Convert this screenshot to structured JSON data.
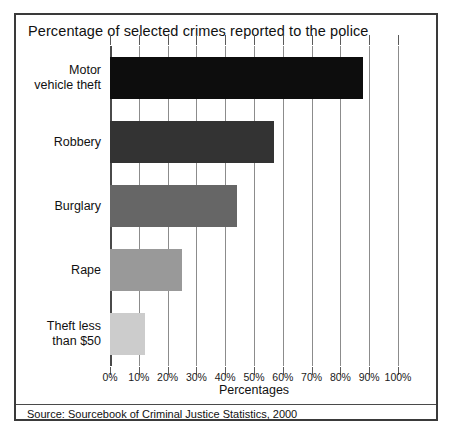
{
  "chart_data": {
    "type": "bar",
    "orientation": "horizontal",
    "title": "Percentage of selected crimes reported to the police",
    "xlabel": "Percentages",
    "ylabel": "",
    "xlim": [
      0,
      100
    ],
    "grid": true,
    "legend": null,
    "categories": [
      "Motor vehicle theft",
      "Robbery",
      "Burglary",
      "Rape",
      "Theft less than $50"
    ],
    "category_lines": [
      [
        "Motor",
        "vehicle theft"
      ],
      [
        "Robbery"
      ],
      [
        "Burglary"
      ],
      [
        "Rape"
      ],
      [
        "Theft less",
        "than $50"
      ]
    ],
    "values": [
      88,
      57,
      44,
      25,
      12
    ],
    "bar_colors": [
      "#0d0d0d",
      "#333333",
      "#666666",
      "#999999",
      "#cccccc"
    ],
    "tick_labels": [
      "0%",
      "10%",
      "20%",
      "30%",
      "40%",
      "50%",
      "60%",
      "70%",
      "80%",
      "90%",
      "100%"
    ],
    "tick_values": [
      0,
      10,
      20,
      30,
      40,
      50,
      60,
      70,
      80,
      90,
      100
    ]
  },
  "footer": {
    "source": "Source: Sourcebook of Criminal Justice Statistics, 2000"
  },
  "style": {
    "frame_color": "#3a3a3a",
    "grid_color": "#8c8c8c",
    "text_color": "#111111"
  }
}
